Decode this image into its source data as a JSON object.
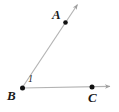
{
  "figure": {
    "type": "geometry-angle-diagram",
    "background_color": "#ffffff",
    "line_color": "#b3b3b3",
    "point_color": "#111111",
    "label_color": "#1a1a1a",
    "width": 119,
    "height": 112
  },
  "labels": {
    "point_a": "A",
    "point_b": "B",
    "point_c": "C",
    "angle_1": "1"
  },
  "geometry": {
    "vertex": {
      "name": "B",
      "x": 22,
      "y": 88
    },
    "points": [
      {
        "name": "A",
        "x": 65,
        "y": 22,
        "dot": true
      },
      {
        "name": "B",
        "x": 22,
        "y": 88,
        "dot": true
      },
      {
        "name": "C",
        "x": 92,
        "y": 87,
        "dot": true
      }
    ],
    "rays": [
      {
        "name": "ray-BA",
        "from": "B",
        "through": "A",
        "x1": 22,
        "y1": 88,
        "x2": 77,
        "y2": 4,
        "arrowhead": "end"
      },
      {
        "name": "ray-BC",
        "from": "B",
        "through": "C",
        "x1": 22,
        "y1": 88,
        "x2": 111,
        "y2": 86,
        "arrowhead": "end"
      }
    ],
    "angle_marks": [
      {
        "label": "1",
        "at_vertex": "B",
        "x": 31,
        "y": 80
      }
    ]
  }
}
